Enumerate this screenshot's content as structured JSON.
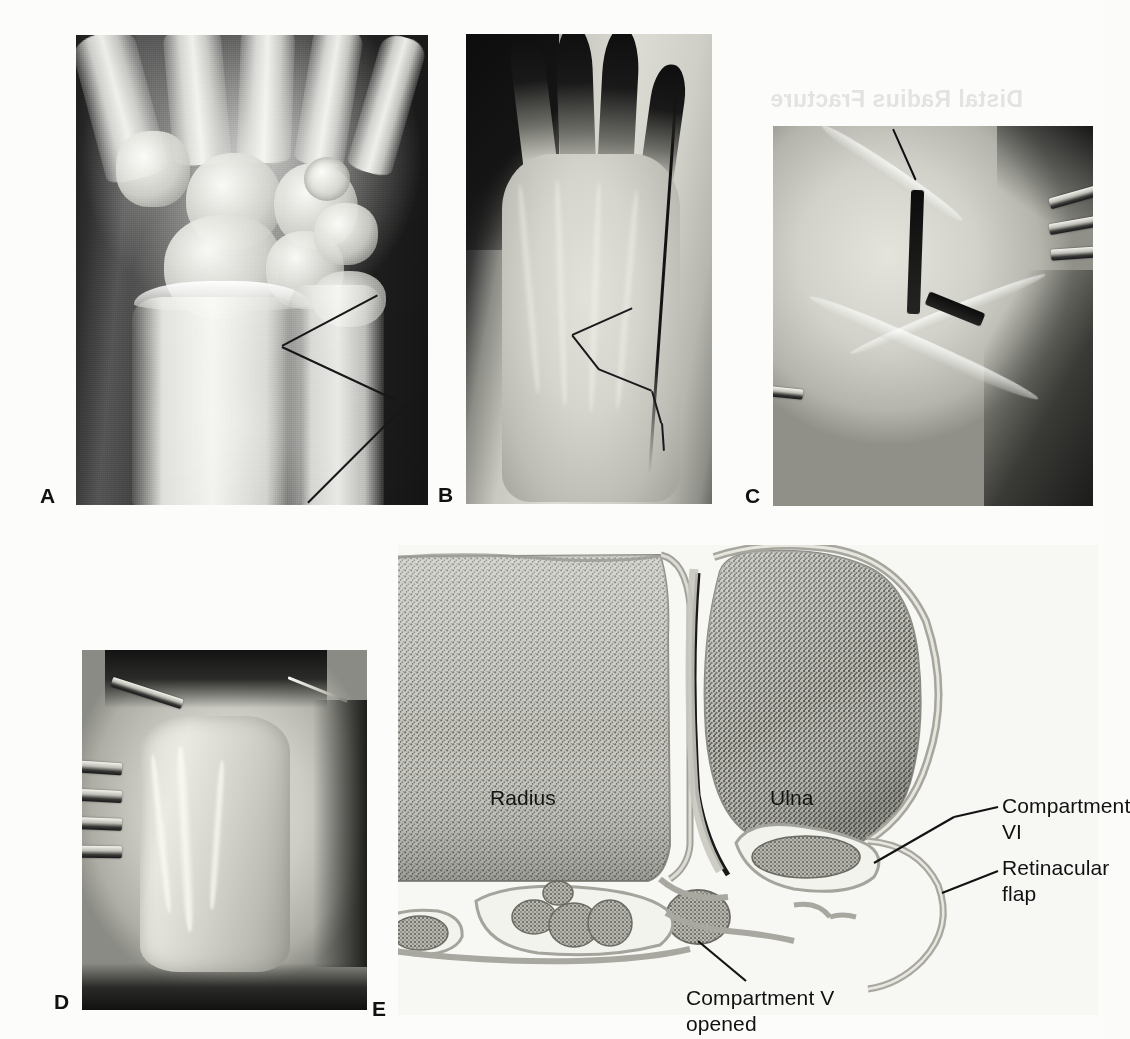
{
  "figure": {
    "caption_ghost": "Distal Radius Fracture",
    "panels": [
      {
        "id": "A",
        "letter": "A",
        "name": "wrist-radiograph",
        "description": "Posteroanterior radiograph of the wrist with angle measurement lines marking radial inclination at the distal radius and ulna"
      },
      {
        "id": "B",
        "letter": "B",
        "name": "hand-incision-marking",
        "description": "Dorsal hand and distal forearm with the planned ulnar-sided skin incision drawn in surgical marker"
      },
      {
        "id": "C",
        "letter": "C",
        "name": "extensor-retinaculum-exposure",
        "description": "Intraoperative exposure of the extensor retinaculum with skin retractors and a suture tag"
      },
      {
        "id": "D",
        "letter": "D",
        "name": "retinacular-flap-raised",
        "description": "Intraoperative view of the elevated retinacular flap held with a needle, self-retaining retractors on the radial side"
      },
      {
        "id": "E",
        "letter": "E",
        "name": "cross-section-diagram",
        "description": "Axial cross-sectional line drawing of the distal radius and ulna showing the retinacular flap and extensor compartments"
      }
    ]
  },
  "panel_e": {
    "labels": [
      {
        "key": "radius",
        "text": "Radius",
        "leader": false
      },
      {
        "key": "ulna",
        "text": "Ulna",
        "leader": false
      },
      {
        "key": "compartment_vi",
        "text": "Compartment VI",
        "leader": true
      },
      {
        "key": "retinacular_flap",
        "text": "Retinacular\nflap",
        "leader": true
      },
      {
        "key": "compartment_v",
        "text": "Compartment V\nopened",
        "leader": true
      }
    ]
  },
  "colors": {
    "page_background": "#fcfcfa",
    "diagram_background": "#f7f7f4",
    "label_text": "#111111",
    "leader_line": "#131313",
    "bone_fill": "#9c9c96",
    "retinaculum_outline": "#8f8f88",
    "xray_bone": "#eeeeea",
    "xray_background": "#1d1d1d"
  }
}
